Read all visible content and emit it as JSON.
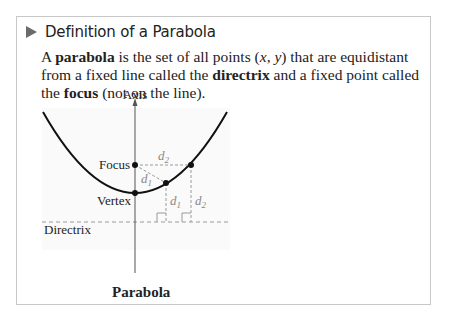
{
  "heading": {
    "icon": "triangle-right-icon",
    "title": "Definition of a Parabola"
  },
  "definition": {
    "part1": "A ",
    "term_parabola": "parabola",
    "part2": " is the set of all points (",
    "var_x": "x",
    "comma": ", ",
    "var_y": "y",
    "part3": ") that are equidistant from a fixed line called the ",
    "term_directrix": "directrix",
    "part4": " and a fixed point called the ",
    "term_focus": "focus",
    "part5": " (not on the line)."
  },
  "figure": {
    "labels": {
      "axis": "Axis",
      "focus": "Focus",
      "vertex": "Vertex",
      "directrix": "Directrix",
      "d1_a": "d",
      "d1_a_sub": "1",
      "d1_b": "d",
      "d1_b_sub": "1",
      "d2_a": "d",
      "d2_a_sub": "2",
      "d2_b": "d",
      "d2_b_sub": "2"
    },
    "caption": "Parabola",
    "colors": {
      "curve": "#111111",
      "dashed": "#9a9a9a",
      "axis": "#555555",
      "point": "#111111",
      "plot_bg": "#fafafa"
    }
  }
}
